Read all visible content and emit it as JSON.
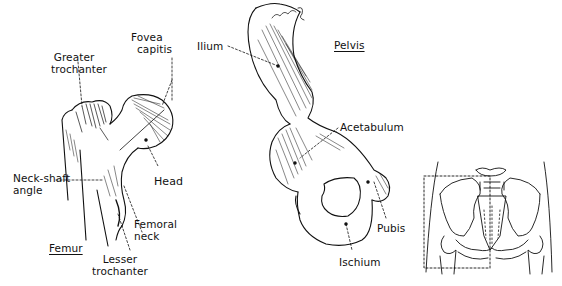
{
  "figure": {
    "panels": [
      {
        "id": "femur",
        "title": "Femur",
        "labels": {
          "greater_trochanter": [
            "Greater",
            "trochanter"
          ],
          "fovea_capitis": [
            "Fovea",
            "capitis"
          ],
          "neck_shaft_angle": [
            "Neck-shaft",
            "angle"
          ],
          "head": "Head",
          "femoral_neck": [
            "Femoral",
            "neck"
          ],
          "lesser_trochanter": [
            "Lesser",
            "trochanter"
          ]
        }
      },
      {
        "id": "pelvis",
        "title": "Pelvis",
        "labels": {
          "ilium": "Ilium",
          "acetabulum": "Acetabulum",
          "pubis": "Pubis",
          "ischium": "Ischium"
        }
      },
      {
        "id": "pelvis-overview",
        "title": "",
        "labels": {}
      }
    ],
    "colors": {
      "ink": "#111111",
      "background": "#ffffff"
    }
  }
}
